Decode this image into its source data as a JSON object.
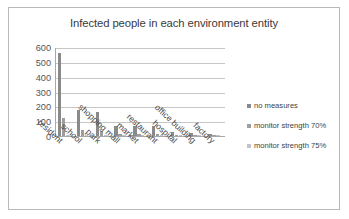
{
  "chart_data": {
    "type": "bar",
    "title": "Infected people in each environment entity",
    "xlabel": "",
    "ylabel": "",
    "ylim": [
      0,
      600
    ],
    "yticks": [
      600,
      500,
      400,
      300,
      200,
      100,
      0
    ],
    "grid": true,
    "legend_position": "right",
    "categories": [
      "resident",
      "school",
      "park",
      "shopping mall",
      "market",
      "restaurant",
      "hospital",
      "office building",
      "factory"
    ],
    "series": [
      {
        "name": "no measures",
        "color": "#8a8a8a",
        "values": [
          560,
          175,
          165,
          70,
          68,
          65,
          30,
          18,
          16
        ]
      },
      {
        "name": "monitor strength 70%",
        "color": "#9e9e9e",
        "values": [
          120,
          40,
          35,
          12,
          12,
          12,
          6,
          5,
          5
        ]
      },
      {
        "name": "monitor strength 75%",
        "color": "#c4c4c4",
        "values": [
          10,
          6,
          5,
          4,
          4,
          4,
          3,
          2,
          2
        ]
      }
    ]
  }
}
